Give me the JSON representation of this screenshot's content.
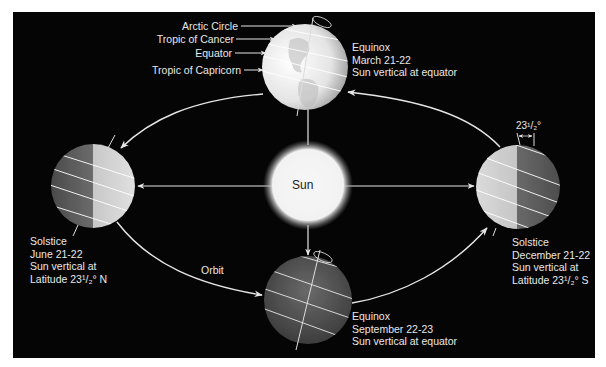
{
  "diagram": {
    "sun": {
      "label": "Sun"
    },
    "orbit_label": "Orbit",
    "latitude_lines": {
      "arctic_circle": "Arctic Circle",
      "tropic_of_cancer": "Tropic of Cancer",
      "equator": "Equator",
      "tropic_of_capricorn": "Tropic of Capricorn"
    },
    "tilt_annotation": "23¹/₂°",
    "positions": [
      {
        "id": "march",
        "event": "Equinox",
        "date": "March 21-22",
        "note": "Sun vertical at equator"
      },
      {
        "id": "june",
        "event": "Solstice",
        "date": "June 21-22",
        "note": "Sun vertical at",
        "note2": "Latitude 23¹/₂° N"
      },
      {
        "id": "september",
        "event": "Equinox",
        "date": "September 22-23",
        "note": "Sun vertical at equator"
      },
      {
        "id": "december",
        "event": "Solstice",
        "date": "December 21-22",
        "note": "Sun vertical at",
        "note2": "Latitude 23¹/₂° S"
      }
    ]
  },
  "colors": {
    "background": "#050505",
    "lines": "#e6e6e6",
    "text": "#e8e8e8"
  }
}
